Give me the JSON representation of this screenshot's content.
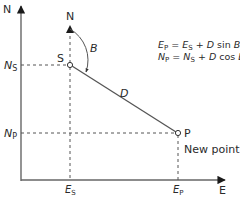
{
  "diagram": {
    "type": "surveying-coordinate-diagram",
    "axes": {
      "north_label": "N",
      "east_label": "E"
    },
    "start_point": {
      "label": "S",
      "north_arrow_label": "N",
      "northing_label_main": "N",
      "northing_label_sub": "S",
      "easting_label_main": "E",
      "easting_label_sub": "S"
    },
    "end_point": {
      "label": "P",
      "caption": "New point",
      "northing_label_main": "N",
      "northing_label_sub": "P",
      "easting_label_main": "E",
      "easting_label_sub": "P"
    },
    "bearing_label": "B",
    "distance_label": "D",
    "formulas": [
      {
        "lhs_main": "E",
        "lhs_sub": "P",
        "eq": " = ",
        "rhs1_main": "E",
        "rhs1_sub": "S",
        "plus": " + ",
        "var": "D",
        "fn": " sin ",
        "angle": "B"
      },
      {
        "lhs_main": "N",
        "lhs_sub": "P",
        "eq": " = ",
        "rhs1_main": "N",
        "rhs1_sub": "S",
        "plus": " + ",
        "var": "D",
        "fn": " cos ",
        "angle": "B"
      }
    ],
    "colors": {
      "line": "#555555",
      "text": "#2a2a2a",
      "background": "#ffffff"
    }
  }
}
